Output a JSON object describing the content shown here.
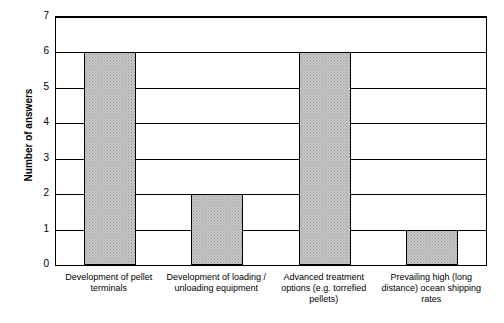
{
  "chart_data": {
    "type": "bar",
    "title": "",
    "xlabel": "",
    "ylabel": "Number of answers",
    "ylim": [
      0,
      7
    ],
    "yticks": [
      "0",
      "1",
      "2",
      "3",
      "4",
      "5",
      "6",
      "7"
    ],
    "grid": true,
    "legend": null,
    "categories": [
      "Development of pellet terminals",
      "Development of loading / unloading equipment",
      "Advanced treatment options (e.g. torrefied pellets)",
      "Prevailing high (long distance) ocean shipping rates"
    ],
    "category_lines": [
      [
        "Development of pellet",
        "terminals"
      ],
      [
        "Development of loading /",
        "unloading equipment"
      ],
      [
        "Advanced treatment",
        "options (e.g. torrefied",
        "pellets)"
      ],
      [
        "Prevailing high (long",
        "distance) ocean shipping",
        "rates"
      ]
    ],
    "values": [
      6,
      2,
      6,
      1
    ],
    "bar_color": "#c8c8c8",
    "bar_edge_color": "#000000"
  }
}
